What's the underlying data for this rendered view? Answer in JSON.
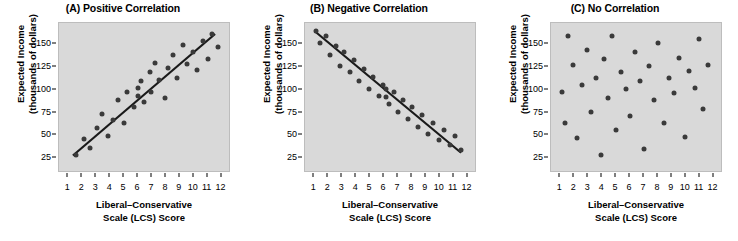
{
  "figure": {
    "background_color": "#ffffff",
    "panel_background_color": "#d9d9d9",
    "dot_color": "#3a3a3a",
    "line_color": "#1a1a1a"
  },
  "axis": {
    "y_ticks": [
      "25",
      "50",
      "75",
      "100",
      "125",
      "150"
    ],
    "x_ticks": [
      "1",
      "2",
      "3",
      "4",
      "5",
      "6",
      "7",
      "8",
      "9",
      "10",
      "11",
      "12"
    ],
    "y_title_line1": "Expected Income",
    "y_title_line2": "(thousands of dollars)",
    "x_title_line1": "Liberal–Conservative",
    "x_title_line2": "Scale (LCS) Score"
  },
  "chart_data": [
    {
      "type": "scatter",
      "title": "(A) Positive Correlation",
      "xlabel": "Liberal–Conservative Scale (LCS) Score",
      "ylabel": "Expected Income (thousands of dollars)",
      "xlim": [
        0.4,
        12.6
      ],
      "ylim": [
        10,
        172
      ],
      "xticks": [
        1,
        2,
        3,
        4,
        5,
        6,
        7,
        8,
        9,
        10,
        11,
        12
      ],
      "yticks": [
        25,
        50,
        75,
        100,
        125,
        150
      ],
      "grid": false,
      "legend": "none",
      "points": [
        [
          1.6,
          28
        ],
        [
          2.2,
          45
        ],
        [
          2.6,
          35
        ],
        [
          3.1,
          57
        ],
        [
          3.5,
          72
        ],
        [
          3.9,
          48
        ],
        [
          4.3,
          66
        ],
        [
          4.6,
          88
        ],
        [
          5.1,
          62
        ],
        [
          5.3,
          96
        ],
        [
          5.8,
          80
        ],
        [
          6.1,
          101
        ],
        [
          6.1,
          92
        ],
        [
          6.3,
          108
        ],
        [
          6.5,
          86
        ],
        [
          6.9,
          118
        ],
        [
          7.0,
          97
        ],
        [
          7.3,
          128
        ],
        [
          7.6,
          110
        ],
        [
          8.0,
          90
        ],
        [
          8.2,
          123
        ],
        [
          8.6,
          137
        ],
        [
          8.9,
          112
        ],
        [
          9.3,
          148
        ],
        [
          9.6,
          127
        ],
        [
          10.0,
          140
        ],
        [
          10.3,
          121
        ],
        [
          10.7,
          152
        ],
        [
          11.1,
          133
        ],
        [
          11.4,
          160
        ],
        [
          11.8,
          146
        ]
      ],
      "trendline": {
        "x1": 1.4,
        "y1": 27,
        "x2": 11.6,
        "y2": 160
      }
    },
    {
      "type": "scatter",
      "title": "(B) Negative Correlation",
      "xlabel": "Liberal–Conservative Scale (LCS) Score",
      "ylabel": "Expected Income (thousands of dollars)",
      "xlim": [
        0.4,
        12.6
      ],
      "ylim": [
        10,
        172
      ],
      "xticks": [
        1,
        2,
        3,
        4,
        5,
        6,
        7,
        8,
        9,
        10,
        11,
        12
      ],
      "yticks": [
        25,
        50,
        75,
        100,
        125,
        150
      ],
      "grid": false,
      "legend": "none",
      "points": [
        [
          1.2,
          163
        ],
        [
          1.5,
          150
        ],
        [
          1.9,
          158
        ],
        [
          2.2,
          137
        ],
        [
          2.6,
          147
        ],
        [
          2.9,
          125
        ],
        [
          3.2,
          140
        ],
        [
          3.6,
          118
        ],
        [
          3.9,
          131
        ],
        [
          4.3,
          108
        ],
        [
          4.6,
          122
        ],
        [
          5.0,
          100
        ],
        [
          5.3,
          113
        ],
        [
          5.7,
          92
        ],
        [
          6.0,
          104
        ],
        [
          6.2,
          100
        ],
        [
          6.2,
          91
        ],
        [
          6.4,
          83
        ],
        [
          6.8,
          96
        ],
        [
          7.1,
          75
        ],
        [
          7.4,
          88
        ],
        [
          7.8,
          67
        ],
        [
          8.1,
          80
        ],
        [
          8.5,
          58
        ],
        [
          8.8,
          71
        ],
        [
          9.2,
          50
        ],
        [
          9.6,
          62
        ],
        [
          10.0,
          44
        ],
        [
          10.4,
          55
        ],
        [
          10.8,
          38
        ],
        [
          11.2,
          48
        ],
        [
          11.6,
          33
        ]
      ],
      "trendline": {
        "x1": 1.1,
        "y1": 163,
        "x2": 11.6,
        "y2": 30
      }
    },
    {
      "type": "scatter",
      "title": "(C) No Correlation",
      "xlabel": "Liberal–Conservative Scale (LCS) Score",
      "ylabel": "Expected Income (thousands of dollars)",
      "xlim": [
        0.4,
        12.6
      ],
      "ylim": [
        10,
        172
      ],
      "xticks": [
        1,
        2,
        3,
        4,
        5,
        6,
        7,
        8,
        9,
        10,
        11,
        12
      ],
      "yticks": [
        25,
        50,
        75,
        100,
        125,
        150
      ],
      "grid": false,
      "legend": "none",
      "points": [
        [
          1.2,
          97
        ],
        [
          1.4,
          62
        ],
        [
          1.6,
          158
        ],
        [
          2.0,
          126
        ],
        [
          2.3,
          46
        ],
        [
          2.6,
          104
        ],
        [
          3.0,
          142
        ],
        [
          3.3,
          75
        ],
        [
          3.6,
          112
        ],
        [
          4.0,
          28
        ],
        [
          4.2,
          133
        ],
        [
          4.5,
          90
        ],
        [
          4.8,
          158
        ],
        [
          5.1,
          55
        ],
        [
          5.4,
          118
        ],
        [
          5.8,
          100
        ],
        [
          6.1,
          70
        ],
        [
          6.4,
          140
        ],
        [
          6.8,
          108
        ],
        [
          7.1,
          34
        ],
        [
          7.4,
          125
        ],
        [
          7.8,
          88
        ],
        [
          8.1,
          150
        ],
        [
          8.5,
          62
        ],
        [
          8.9,
          112
        ],
        [
          9.2,
          95
        ],
        [
          9.6,
          134
        ],
        [
          10.0,
          47
        ],
        [
          10.3,
          120
        ],
        [
          10.7,
          101
        ],
        [
          11.0,
          155
        ],
        [
          11.3,
          78
        ],
        [
          11.7,
          126
        ]
      ],
      "trendline": null
    }
  ]
}
